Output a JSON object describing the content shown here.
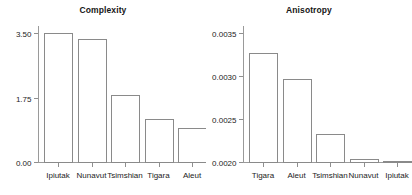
{
  "figure": {
    "background": "#ffffff",
    "bar_fill": "#ffffff",
    "bar_edge": "#8a8a8a",
    "axis_color": "#9a9a9a"
  },
  "chart_data": [
    {
      "type": "bar",
      "id": "complexity",
      "title": "Complexity",
      "xlabel": "",
      "ylabel": "",
      "categories": [
        "Ipiutak",
        "Nunavut",
        "Tsimshian",
        "Tigara",
        "Aleut"
      ],
      "values": [
        3.49,
        3.35,
        1.83,
        1.16,
        0.92
      ],
      "ylim": [
        0.0,
        3.85
      ],
      "yticks": [
        0.0,
        1.75,
        3.5
      ],
      "ytick_labels": [
        "0.00",
        "1.75",
        "3.50"
      ],
      "grid": false,
      "legend": "none",
      "orientation": "vertical"
    },
    {
      "type": "bar",
      "id": "anisotropy",
      "title": "Anisotropy",
      "xlabel": "",
      "ylabel": "",
      "categories": [
        "Tigara",
        "Aleut",
        "Tsimshian",
        "Nunavut",
        "Ipiutak"
      ],
      "values": [
        0.00327,
        0.00296,
        0.00232,
        0.00204,
        0.00201
      ],
      "ylim": [
        0.002,
        0.00365
      ],
      "yticks": [
        0.002,
        0.0025,
        0.003,
        0.0035
      ],
      "ytick_labels": [
        "0.0020",
        "0.0025",
        "0.0030",
        "0.0035"
      ],
      "grid": false,
      "legend": "none",
      "orientation": "vertical"
    }
  ]
}
